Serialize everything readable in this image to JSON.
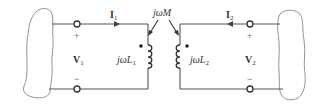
{
  "diagram": {
    "type": "coupled-inductor-circuit",
    "mutual": {
      "label": "jωM"
    },
    "left_port": {
      "current": {
        "symbol": "I",
        "sub": "1",
        "direction": "right"
      },
      "voltage": {
        "symbol": "V",
        "sub": "1"
      },
      "plus": "+",
      "minus": "−",
      "inductor": {
        "prefix": "jω",
        "symbol": "L",
        "sub": "1",
        "dot": "top"
      }
    },
    "right_port": {
      "current": {
        "symbol": "I",
        "sub": "2",
        "direction": "left"
      },
      "voltage": {
        "symbol": "V",
        "sub": "2"
      },
      "plus": "+",
      "minus": "−",
      "inductor": {
        "prefix": "jω",
        "symbol": "L",
        "sub": "2",
        "dot": "top"
      }
    }
  },
  "colors": {
    "wire": "#555555",
    "blob": "#888888",
    "text": "#333333"
  }
}
